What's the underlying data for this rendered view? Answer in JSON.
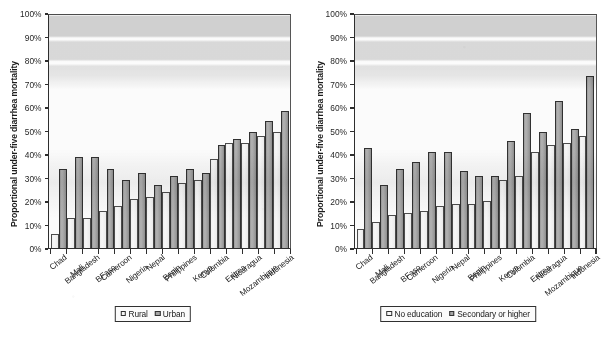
{
  "figure": {
    "panels": [
      {
        "name": "residence-panel",
        "ylabel": "Proportional under-five diarrhea mortality",
        "legend": [
          {
            "label": "Rural",
            "swatch": "light"
          },
          {
            "label": "Urban",
            "swatch": "dark"
          }
        ]
      },
      {
        "name": "education-panel",
        "ylabel": "Proportional under-five diarrhea mortality",
        "legend": [
          {
            "label": "No education",
            "swatch": "light"
          },
          {
            "label": "Secondary or higher",
            "swatch": "dark"
          }
        ]
      }
    ],
    "yticks": [
      "100%",
      "90%",
      "80%",
      "70%",
      "60%",
      "50%",
      "40%",
      "30%",
      "20%",
      "10%",
      "0%"
    ]
  },
  "chart_data": [
    {
      "type": "bar",
      "title": "",
      "xlabel": "",
      "ylabel": "Proportional under-five diarrhea mortality",
      "ylim": [
        0,
        100
      ],
      "ytick_values": [
        0,
        10,
        20,
        30,
        40,
        50,
        60,
        70,
        80,
        90,
        100
      ],
      "ytick_labels": [
        "0%",
        "10%",
        "20%",
        "30%",
        "40%",
        "50%",
        "60%",
        "70%",
        "80%",
        "90%",
        "100%"
      ],
      "grid": false,
      "legend_position": "bottom",
      "categories": [
        "Chad",
        "Mali",
        "Bangladesh",
        "BFaso",
        "Cameroon",
        "Nigeria",
        "Nepal",
        "Benin",
        "Philippines",
        "Kenya",
        "Colombia",
        "Eritrea",
        "Nicaragua",
        "Mozambique",
        "Indonesia"
      ],
      "series": [
        {
          "name": "Rural",
          "values": [
            6,
            13,
            13,
            16,
            18,
            21,
            22,
            24,
            28,
            29,
            38,
            45,
            45,
            48,
            50
          ]
        },
        {
          "name": "Urban",
          "values": [
            34,
            39,
            39,
            34,
            29,
            32,
            27,
            31,
            34,
            32,
            44,
            47,
            50,
            54.5,
            59
          ]
        }
      ]
    },
    {
      "type": "bar",
      "title": "",
      "xlabel": "",
      "ylabel": "Proportional under-five diarrhea mortality",
      "ylim": [
        0,
        100
      ],
      "ytick_values": [
        0,
        10,
        20,
        30,
        40,
        50,
        60,
        70,
        80,
        90,
        100
      ],
      "ytick_labels": [
        "0%",
        "10%",
        "20%",
        "30%",
        "40%",
        "50%",
        "60%",
        "70%",
        "80%",
        "90%",
        "100%"
      ],
      "grid": false,
      "legend_position": "bottom",
      "categories": [
        "Chad",
        "Mali",
        "Bangladesh",
        "BFaso",
        "Cameroon",
        "Nigeria",
        "Nepal",
        "Benin",
        "Philippines",
        "Kenya",
        "Colombia",
        "Eritrea",
        "Nicaragua",
        "Mozambique",
        "Indonesia"
      ],
      "series": [
        {
          "name": "No education",
          "values": [
            8,
            11,
            14,
            15,
            16,
            18,
            19,
            19,
            20,
            29,
            31,
            41,
            44,
            45,
            48
          ]
        },
        {
          "name": "Secondary or higher",
          "values": [
            43,
            27,
            34,
            37,
            41,
            41,
            33,
            31,
            31,
            46,
            58,
            50,
            63,
            51,
            74
          ]
        }
      ]
    }
  ]
}
